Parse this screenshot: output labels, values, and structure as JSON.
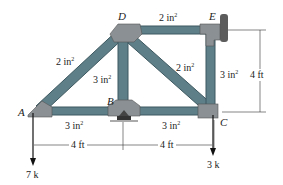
{
  "figure": {
    "nodes": {
      "A": {
        "label": "A",
        "x": 38,
        "y": 111
      },
      "B": {
        "label": "B",
        "x": 123,
        "y": 111
      },
      "C": {
        "label": "C",
        "x": 210,
        "y": 111
      },
      "D": {
        "label": "D",
        "x": 123,
        "y": 30
      },
      "E": {
        "label": "E",
        "x": 210,
        "y": 30
      }
    },
    "members": [
      {
        "id": "AB",
        "area": "3 in",
        "exp": "2"
      },
      {
        "id": "BC",
        "area": "3 in",
        "exp": "2"
      },
      {
        "id": "AD",
        "area": "2 in",
        "exp": "2"
      },
      {
        "id": "BD",
        "area": "3 in",
        "exp": "2"
      },
      {
        "id": "DE",
        "area": "2 in",
        "exp": "2"
      },
      {
        "id": "DC",
        "area": "2 in",
        "exp": "2"
      },
      {
        "id": "EC",
        "area": "3 in",
        "exp": "2"
      }
    ],
    "dimensions": {
      "AB": "4 ft",
      "BC": "4 ft",
      "EC_height": "4 ft"
    },
    "loads": {
      "A": "7 k",
      "C": "3 k"
    },
    "colors": {
      "member": "#5f7f88",
      "member_edge": "#3d5860",
      "gusset": "#8a9094",
      "wall": "#6a6a6a"
    }
  }
}
